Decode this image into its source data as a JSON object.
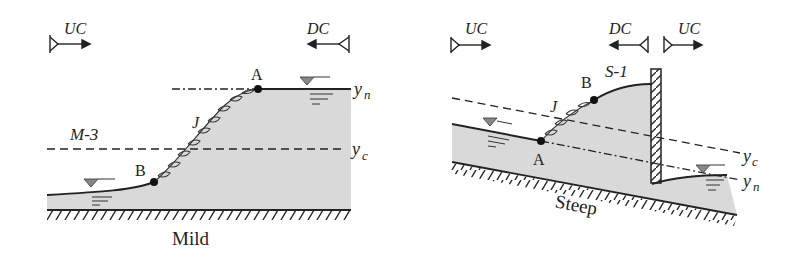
{
  "colors": {
    "water": "#d9d9d9",
    "ink": "#222222",
    "background": "#ffffff"
  },
  "left_panel": {
    "bed_label": "Mild",
    "upstream_control": "UC",
    "downstream_control": "DC",
    "profile_label": "M-3",
    "jump_label": "J",
    "point_a": "A",
    "point_b": "B",
    "normal_depth": "y",
    "normal_depth_sub": "n",
    "critical_depth": "y",
    "critical_depth_sub": "c"
  },
  "right_panel": {
    "bed_label": "Steep",
    "upstream_control_1": "UC",
    "downstream_control": "DC",
    "upstream_control_2": "UC",
    "profile_label": "S-1",
    "jump_label": "J",
    "point_a": "A",
    "point_b": "B",
    "normal_depth": "y",
    "normal_depth_sub": "n",
    "critical_depth": "y",
    "critical_depth_sub": "c"
  }
}
